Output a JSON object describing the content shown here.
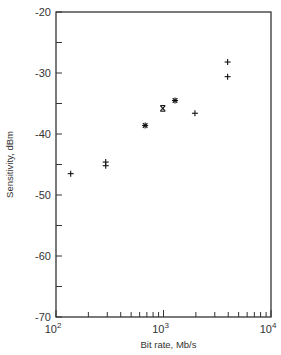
{
  "chart_data": {
    "type": "scatter",
    "title": "",
    "xlabel": "Bit rate, Mb/s",
    "ylabel": "Sensitivity, dBm",
    "xscale": "log",
    "xlim": [
      100,
      10000
    ],
    "ylim": [
      -70,
      -20
    ],
    "x_tick_labels": [
      {
        "base": "10",
        "exp": "2",
        "value": 100
      },
      {
        "base": "10",
        "exp": "3",
        "value": 1000
      },
      {
        "base": "10",
        "exp": "4",
        "value": 10000
      }
    ],
    "y_ticks": [
      -20,
      -30,
      -40,
      -50,
      -60,
      -70
    ],
    "y_tick_labels": [
      "-20",
      "-30",
      "-40",
      "-50",
      "-60",
      "-70"
    ],
    "y_minor_ticks": [
      -25,
      -35,
      -45,
      -55,
      -65
    ],
    "grid": false,
    "legend": null,
    "series": [
      {
        "name": "measurements",
        "points": [
          {
            "x": 137,
            "y": -46.5,
            "marker": "plus"
          },
          {
            "x": 290,
            "y": -44.6,
            "marker": "plus"
          },
          {
            "x": 290,
            "y": -45.2,
            "marker": "plus"
          },
          {
            "x": 675,
            "y": -38.6,
            "marker": "star"
          },
          {
            "x": 985,
            "y": -35.8,
            "marker": "boxed-x"
          },
          {
            "x": 1280,
            "y": -34.5,
            "marker": "star"
          },
          {
            "x": 1960,
            "y": -36.6,
            "marker": "plus"
          },
          {
            "x": 3950,
            "y": -28.2,
            "marker": "plus"
          },
          {
            "x": 3950,
            "y": -30.6,
            "marker": "plus"
          }
        ]
      }
    ]
  },
  "layout": {
    "plot": {
      "left": 56,
      "top": 12,
      "right": 271,
      "bottom": 317
    },
    "colors": {
      "axis": "#333333",
      "marker": "#111111",
      "text": "#333333"
    }
  }
}
